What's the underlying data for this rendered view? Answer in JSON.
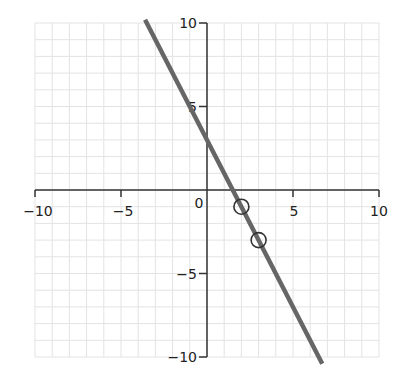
{
  "chart_data": {
    "type": "line",
    "title": "",
    "xlabel": "",
    "ylabel": "",
    "xlim": [
      -10,
      10
    ],
    "ylim": [
      -10,
      10
    ],
    "grid": true,
    "grid_step": 1,
    "x_tick_labels": [
      "−10",
      "−5",
      "0",
      "5",
      "10"
    ],
    "y_tick_labels": [
      "10",
      "5",
      "−5",
      "−10"
    ],
    "series": [
      {
        "name": "y = -2x + 3",
        "slope": -2,
        "intercept": 3,
        "x": [
          -3.6,
          6.7
        ],
        "y": [
          10.2,
          -10.4
        ],
        "color": "#666666"
      }
    ],
    "marked_points": [
      {
        "x": 2,
        "y": -1
      },
      {
        "x": 3,
        "y": -3
      }
    ]
  },
  "colors": {
    "grid": "#e3e3e3",
    "axis": "#333333",
    "line": "#666666",
    "marker": "#333333"
  }
}
